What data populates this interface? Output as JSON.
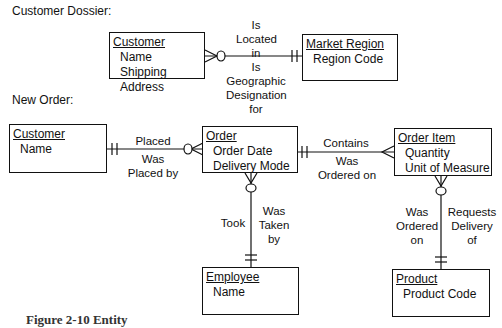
{
  "sections": {
    "dossier_label": "Customer Dossier:",
    "new_order_label": "New Order:"
  },
  "entities": {
    "customer_dossier": {
      "name": "Customer",
      "attributes": [
        "Name",
        "Shipping Address"
      ]
    },
    "market_region": {
      "name": "Market Region",
      "attributes": [
        "Region Code"
      ]
    },
    "customer_order": {
      "name": "Customer",
      "attributes": [
        "Name"
      ]
    },
    "order": {
      "name": "Order",
      "attributes": [
        "Order Date",
        "Delivery Mode"
      ]
    },
    "order_item": {
      "name": "Order Item",
      "attributes": [
        "Quantity",
        "Unit of Measure"
      ]
    },
    "employee": {
      "name": "Employee",
      "attributes": [
        "Name"
      ]
    },
    "product": {
      "name": "Product",
      "attributes": [
        "Product Code"
      ]
    }
  },
  "relationships": {
    "customer_region": {
      "forward": [
        "Is",
        "Located",
        "in"
      ],
      "reverse": [
        "Is",
        "Geographic",
        "Designation",
        "for"
      ]
    },
    "customer_order": {
      "forward": "Placed",
      "reverse": [
        "Was",
        "Placed by"
      ]
    },
    "order_item": {
      "forward": "Contains",
      "reverse": [
        "Was",
        "Ordered on"
      ]
    },
    "order_employee": {
      "forward": "Took",
      "reverse": [
        "Was",
        "Taken",
        "by"
      ]
    },
    "item_product": {
      "forward": [
        "Was",
        "Ordered",
        "on"
      ],
      "reverse": [
        "Requests",
        "Delivery",
        "of"
      ]
    }
  },
  "caption": "Figure 2-10  Entity"
}
